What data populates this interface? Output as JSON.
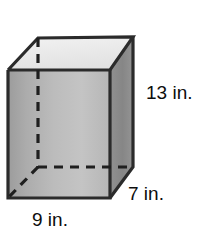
{
  "figure": {
    "name": "rectangular-prism-diagram",
    "shape": "rectangular prism",
    "title": "",
    "solid_fills": {
      "top_face": "#ececec",
      "front_face_light": "#c3c3c3",
      "front_face_dark": "#9e9e9e",
      "right_face": "#8c8c8c",
      "edge_color": "#2b2b2b",
      "hidden_edge_color": "#1f1f1f",
      "background": "#ffffff"
    },
    "labels": {
      "height": "13 in.",
      "depth": "7 in.",
      "width": "9 in."
    },
    "measurements": [
      {
        "edge": "height",
        "value": 13,
        "unit": "in."
      },
      {
        "edge": "depth",
        "value": 7,
        "unit": "in."
      },
      {
        "edge": "width",
        "value": 9,
        "unit": "in."
      }
    ]
  }
}
